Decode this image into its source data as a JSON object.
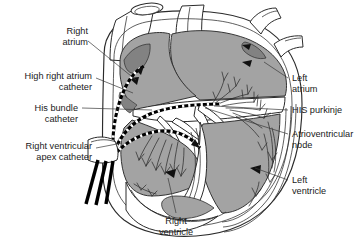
{
  "figure": {
    "background_color": "#ffffff",
    "colors": {
      "myocardium_gray": "#a3a3a3",
      "dark_gray": "#828282",
      "outline": "#2b2b2b",
      "catheter_black": "#000000",
      "leader_line": "#3a3a3a",
      "text": "#1a1a1a"
    }
  },
  "labels": {
    "right_atrium": {
      "line1": "Right",
      "line2": "atrium"
    },
    "high_right_atrium_catheter": {
      "line1": "High right atrium",
      "line2": "catheter"
    },
    "his_bundle_catheter": {
      "line1": "His bundle",
      "line2": "catheter"
    },
    "right_ventricular_apex_catheter": {
      "line1": "Right ventricular",
      "line2": "apex catheter"
    },
    "left_atrium": {
      "line1": "Left",
      "line2": "atrium"
    },
    "his_purkinje": {
      "line1": "HIS purkinje",
      "line2": ""
    },
    "atrioventricular_node": {
      "line1": "Atrioventricular",
      "line2": "node"
    },
    "left_ventricle": {
      "line1": "Left",
      "line2": "ventricle"
    },
    "right_ventricle": {
      "line1": "Right",
      "line2": "ventricle"
    }
  },
  "catheters": [
    {
      "name": "high-right-atrium-catheter",
      "target": "right atrium roof"
    },
    {
      "name": "his-bundle-catheter",
      "target": "His bundle / tricuspid annulus"
    },
    {
      "name": "right-ventricular-apex-catheter",
      "target": "right ventricular apex"
    }
  ],
  "anatomy": [
    "superior vena cava",
    "aorta",
    "pulmonary veins",
    "right atrium",
    "left atrium",
    "right ventricle",
    "left ventricle",
    "interventricular septum",
    "atrioventricular node",
    "His purkinje fibers"
  ]
}
